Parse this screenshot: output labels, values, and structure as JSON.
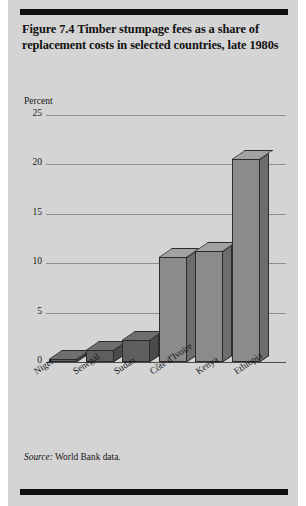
{
  "figure": {
    "title": "Figure 7.4  Timber stumpage fees as a share of replacement costs in selected countries, late 1980s",
    "panel_color": "#d4d4d4",
    "rule_color": "#101010",
    "source_prefix": "Source:",
    "source_text": "World Bank data."
  },
  "chart_data": {
    "type": "bar",
    "title": "Figure 7.4  Timber stumpage fees as a share of replacement costs in selected countries, late 1980s",
    "subtitle": "",
    "xlabel": "",
    "ylabel": "Percent",
    "categories": [
      "Niger",
      "Senegal",
      "Sudan",
      "Côte d'Ivoire",
      "Kenya",
      "Ethiopia"
    ],
    "values": [
      0.3,
      1.2,
      2.2,
      10.6,
      11.2,
      20.5
    ],
    "ylim": [
      0,
      25
    ],
    "yticks": [
      0,
      5,
      10,
      15,
      20,
      25
    ],
    "ytick_labels": [
      "0",
      "5",
      "10",
      "15",
      "20",
      "25"
    ],
    "grid": true,
    "legend": "none",
    "bar_style": "3d-block",
    "bar_colors": {
      "front": "#8b8b8b",
      "side": "#6d6d6d",
      "top": "#a2a2a2",
      "front_dark": "#5e5e5e",
      "side_dark": "#4b4b4b",
      "top_dark": "#6f6f6f",
      "outline": "#2b2b2b"
    },
    "gridline_color": "#8d8d8d"
  }
}
